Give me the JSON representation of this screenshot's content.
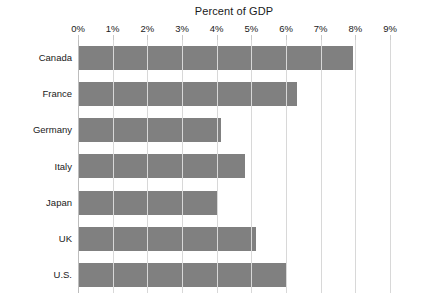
{
  "chart_data": {
    "type": "bar",
    "orientation": "horizontal",
    "title": "Percent of GDP",
    "xlabel": "",
    "ylabel": "",
    "categories": [
      "Canada",
      "France",
      "Germany",
      "Italy",
      "Japan",
      "UK",
      "U.S."
    ],
    "values": [
      7.9,
      6.3,
      4.1,
      4.8,
      4.0,
      5.1,
      6.0
    ],
    "tick_labels": [
      "0%",
      "1%",
      "2%",
      "3%",
      "4%",
      "5%",
      "6%",
      "7%",
      "8%",
      "9%"
    ],
    "tick_values": [
      0,
      1,
      2,
      3,
      4,
      5,
      6,
      7,
      8,
      9
    ],
    "xlim": [
      0,
      9
    ],
    "grid": true,
    "legend": false,
    "bar_color": "#808080",
    "gridline_color": "#d8d8d8",
    "background_color": "#ffffff",
    "text_color": "#1a1a1a"
  }
}
